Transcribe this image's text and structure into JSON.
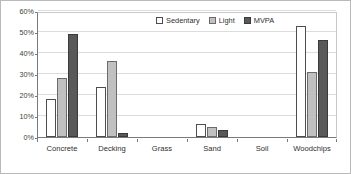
{
  "chart_data": {
    "type": "bar",
    "title": "",
    "xlabel": "",
    "ylabel": "",
    "ylim": [
      0,
      60
    ],
    "ytick_labels": [
      "0%",
      "10%",
      "20%",
      "30%",
      "40%",
      "50%",
      "60%"
    ],
    "ytick_values": [
      0,
      10,
      20,
      30,
      40,
      50,
      60
    ],
    "grid": true,
    "legend_position": "top-right",
    "categories": [
      "Concrete",
      "Decking",
      "Grass",
      "Sand",
      "Soil",
      "Woodchips"
    ],
    "series": [
      {
        "name": "Sedentary",
        "color": "#ffffff",
        "values": [
          18,
          24,
          0,
          6,
          0,
          53
        ]
      },
      {
        "name": "Light",
        "color": "#c0c0c0",
        "values": [
          28,
          36,
          0,
          5,
          0,
          31
        ]
      },
      {
        "name": "MVPA",
        "color": "#595959",
        "values": [
          49,
          2,
          0,
          3.5,
          0,
          46
        ]
      }
    ]
  },
  "legend": {
    "items": [
      {
        "label": "Sedentary",
        "swatch": "legend-swatch-sedentary"
      },
      {
        "label": "Light",
        "swatch": "legend-swatch-light"
      },
      {
        "label": "MVPA",
        "swatch": "legend-swatch-mvpa"
      }
    ]
  }
}
